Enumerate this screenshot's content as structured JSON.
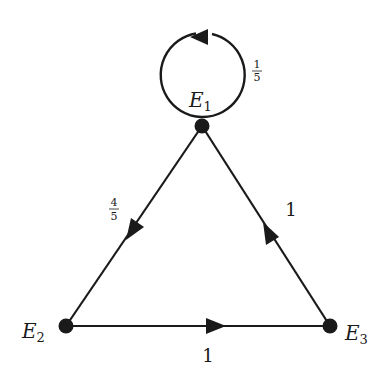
{
  "diagram": {
    "type": "directed-graph",
    "nodes": [
      {
        "id": "E1",
        "label": "E",
        "sub": "1"
      },
      {
        "id": "E2",
        "label": "E",
        "sub": "2"
      },
      {
        "id": "E3",
        "label": "E",
        "sub": "3"
      }
    ],
    "edges": [
      {
        "from": "E1",
        "to": "E1",
        "weight_num": "1",
        "weight_den": "5"
      },
      {
        "from": "E1",
        "to": "E2",
        "weight_num": "4",
        "weight_den": "5"
      },
      {
        "from": "E2",
        "to": "E3",
        "weight": "1"
      },
      {
        "from": "E3",
        "to": "E1",
        "weight": "1"
      }
    ]
  },
  "colors": {
    "stroke": "#1a1a1a",
    "background": "#ffffff"
  }
}
